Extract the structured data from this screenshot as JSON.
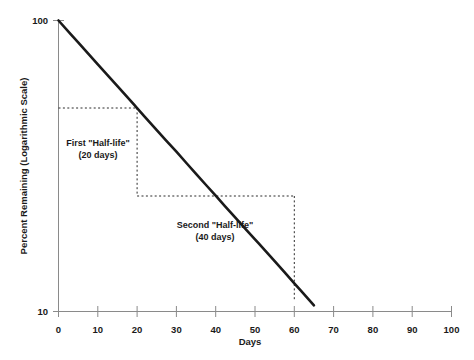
{
  "chart_data": {
    "type": "line",
    "title": "",
    "xlabel": "Days",
    "ylabel": "Percent Remaining (Logarithmic Scale)",
    "yscale": "log",
    "xlim": [
      0,
      100
    ],
    "ylim": [
      10,
      100
    ],
    "grid": false,
    "legend": null,
    "x_ticks": [
      0,
      10,
      20,
      30,
      40,
      50,
      60,
      70,
      80,
      90,
      100
    ],
    "x_tick_labels": [
      "0",
      "10",
      "20",
      "30",
      "40",
      "50",
      "60",
      "70",
      "80",
      "90",
      "100"
    ],
    "y_ticks": [
      10,
      100
    ],
    "y_tick_labels": [
      "10",
      "100"
    ],
    "series": [
      {
        "name": "Percent Remaining",
        "x": [
          0,
          5,
          10,
          15,
          20,
          25,
          30,
          35,
          40,
          45,
          50,
          55,
          60,
          65,
          70,
          75,
          80,
          85,
          90,
          95,
          100
        ],
        "values": [
          100.0,
          84.1,
          70.7,
          59.5,
          50.0,
          42.0,
          35.4,
          29.7,
          25.0,
          21.0,
          17.7,
          14.9,
          12.5,
          10.5,
          8.8,
          7.4,
          6.3,
          5.3,
          4.4,
          3.7,
          3.1
        ]
      }
    ],
    "annotations": [
      {
        "name": "first-half-life",
        "line1": "First \"Half-life\"",
        "line2": "(20 days)",
        "x_span": [
          0,
          20
        ],
        "y_value": 50
      },
      {
        "name": "second-half-life",
        "line1": "Second \"Half-life\"",
        "line2": "(40 days)",
        "x_span": [
          20,
          60
        ],
        "y_value": 25
      }
    ],
    "colors": {
      "curve": "#1a1a1a",
      "axis": "#8a8a8a",
      "guide": "#2b2b2b",
      "background": "#ffffff",
      "text": "#1a1a1a"
    }
  }
}
